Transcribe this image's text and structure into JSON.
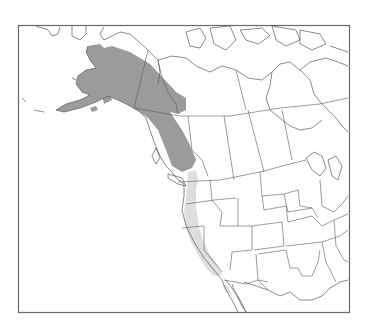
{
  "map": {
    "type": "species-range-map",
    "region": "Western North America",
    "frame": {
      "x": 18,
      "y": 25,
      "width": 332,
      "height": 288
    },
    "colors": {
      "background": "#ffffff",
      "outline": "#5a5a5a",
      "frame": "#6a6a6a",
      "range_primary": "#9b9b9b",
      "range_secondary": "#dedede"
    },
    "ranges": [
      {
        "name": "range-primary",
        "description": "Alaska, Yukon, northern British Columbia",
        "color": "#9b9b9b"
      },
      {
        "name": "range-secondary",
        "description": "Pacific coast: Washington, Oregon, California",
        "color": "#dedede"
      }
    ]
  }
}
